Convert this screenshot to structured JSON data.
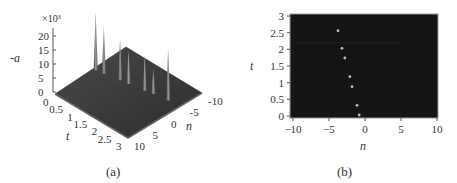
{
  "figure": {
    "panels": [
      {
        "id": "a",
        "caption": "(a)"
      },
      {
        "id": "b",
        "caption": "(b)"
      }
    ]
  },
  "chart_data": [
    {
      "type": "surface3d",
      "panel": "(a)",
      "title": "",
      "zlabel": "-a",
      "zscale_label": "×10³",
      "xlabel": "t",
      "ylabel": "n",
      "z_ticks": [
        "0",
        "5",
        "10",
        "15",
        "20"
      ],
      "t_ticks": [
        "0",
        "0.5",
        "1",
        "1.5",
        "2",
        "2.5",
        "3"
      ],
      "n_ticks": [
        "-10",
        "-5",
        "0",
        "5",
        "10"
      ],
      "zlim": [
        0,
        22000
      ],
      "tlim": [
        0,
        3
      ],
      "nlim": [
        -10,
        10
      ],
      "peaks": [
        {
          "n": -0.8,
          "t": 0.03,
          "height": 21000
        },
        {
          "n": -1.1,
          "t": 0.32,
          "height": 17000
        },
        {
          "n": -1.8,
          "t": 0.88,
          "height": 15000
        },
        {
          "n": -2.1,
          "t": 1.18,
          "height": 12000
        },
        {
          "n": -2.8,
          "t": 1.74,
          "height": 13000
        },
        {
          "n": -3.2,
          "t": 2.03,
          "height": 9000
        },
        {
          "n": -3.75,
          "t": 2.56,
          "height": 19000
        }
      ]
    },
    {
      "type": "density",
      "panel": "(b)",
      "title": "",
      "xlabel": "n",
      "ylabel": "t",
      "x_ticks": [
        "-10",
        "-5",
        "0",
        "5",
        "10"
      ],
      "y_ticks": [
        "0",
        "0.5",
        "1",
        "1.5",
        "2",
        "2.5",
        "3"
      ],
      "xlim": [
        -10,
        10
      ],
      "ylim": [
        0,
        3
      ],
      "background": "#141414",
      "points": [
        {
          "n": -3.75,
          "t": 2.56
        },
        {
          "n": -3.2,
          "t": 2.03
        },
        {
          "n": -2.8,
          "t": 1.74
        },
        {
          "n": -2.1,
          "t": 1.18
        },
        {
          "n": -1.8,
          "t": 0.88
        },
        {
          "n": -1.1,
          "t": 0.32
        },
        {
          "n": -0.8,
          "t": 0.03
        }
      ]
    }
  ]
}
